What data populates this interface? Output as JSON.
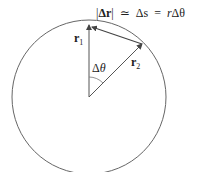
{
  "equation": {
    "abs_open": "|",
    "delta_r": "Δr",
    "abs_close": "|",
    "approx": "≃",
    "delta_s": "Δs",
    "equals": "=",
    "r": "r",
    "delta_theta": "Δθ"
  },
  "labels": {
    "r1_base": "r",
    "r1_sub": "1",
    "r2_base": "r",
    "r2_sub": "2",
    "angle_delta": "Δ",
    "angle_theta": "θ"
  },
  "colors": {
    "stroke": "#555555",
    "text": "#222222"
  }
}
